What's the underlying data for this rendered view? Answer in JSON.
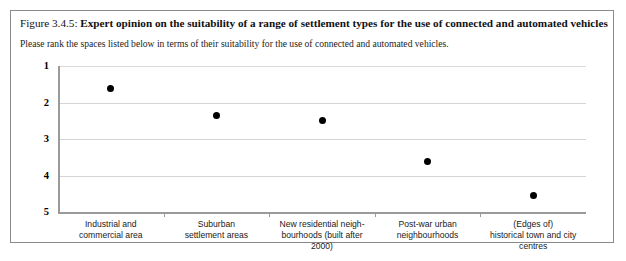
{
  "figure": {
    "number_label": "Figure 3.4.5:",
    "title": "Expert opinion on the suitability of a range of settlement types for the use of connected and automated vehicles",
    "subtitle": "Please rank the spaces listed below in terms of their suitability for the use of connected and automated vehicles."
  },
  "chart_data": {
    "type": "scatter",
    "title": "Expert opinion on the suitability of a range of settlement types for the use of connected and automated vehicles",
    "subtitle": "Please rank the spaces listed below in terms of their suitability for the use of connected and automated vehicles.",
    "xlabel": "",
    "ylabel": "",
    "categories": [
      "Industrial and commercial area",
      "Suburban settlement areas",
      "New residential neigh-bourhoods (built after 2000)",
      "Post-war urban neighbourhoods",
      "(Edges of) historical town and city centres"
    ],
    "category_lines": [
      [
        "Industrial and",
        "commercial area"
      ],
      [
        "Suburban",
        "settlement areas"
      ],
      [
        "New residential neigh-",
        "bourhoods (built after",
        "2000)"
      ],
      [
        "Post-war urban",
        "neighbourhoods"
      ],
      [
        "(Edges of)",
        "historical town and city",
        "centres"
      ]
    ],
    "values": [
      1.63,
      2.36,
      2.48,
      3.63,
      4.56
    ],
    "ytick_labels": [
      "1",
      "2",
      "3",
      "4",
      "5"
    ],
    "ylim": [
      1,
      5
    ],
    "y_axis_inverted": true,
    "grid": true,
    "legend": "none",
    "marker": "filled-circle",
    "marker_color": "#000000",
    "gridline_color": "#d4d4d4",
    "axis_color": "#9a9a9a"
  }
}
